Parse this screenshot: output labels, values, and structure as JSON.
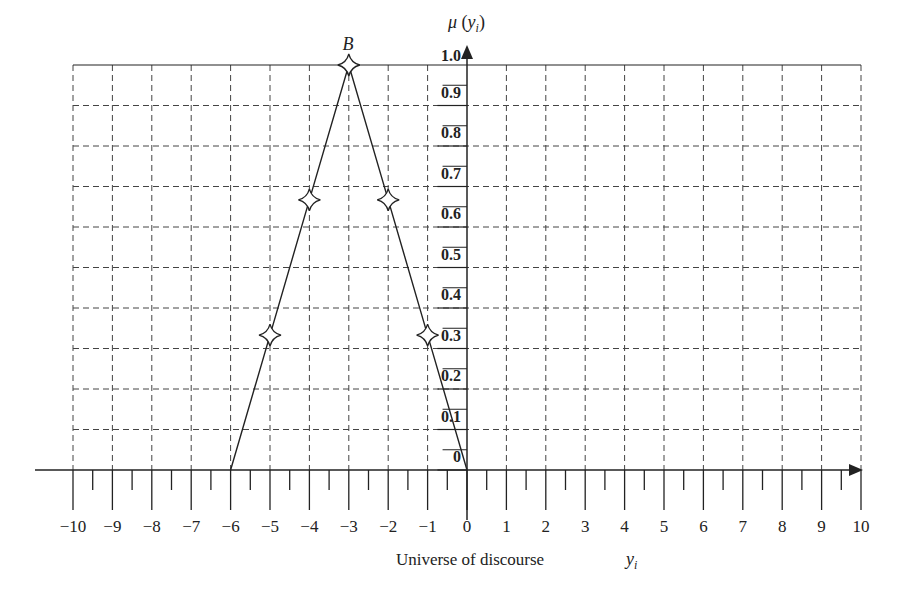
{
  "chart_data": {
    "type": "line",
    "title": "",
    "series": [
      {
        "name": "B",
        "x": [
          -6,
          -5,
          -4,
          -3,
          -2,
          -1,
          0
        ],
        "y": [
          0,
          0.333,
          0.667,
          1.0,
          0.667,
          0.333,
          0
        ],
        "markers": [
          {
            "x": -5,
            "y": 0.333
          },
          {
            "x": -4,
            "y": 0.667
          },
          {
            "x": -3,
            "y": 1.0
          },
          {
            "x": -2,
            "y": 0.667
          },
          {
            "x": -1,
            "y": 0.333
          }
        ]
      }
    ],
    "annotations": [
      {
        "text": "B",
        "x": -3,
        "y": 1.0
      }
    ],
    "xlabel": "Universe of discourse",
    "xvar": "y",
    "xvar_sub": "i",
    "ylabel": "μ (y_i)",
    "ylabel_parts": {
      "mu": "μ",
      "open": " (",
      "var": "y",
      "sub": "i",
      "close": ")"
    },
    "xlim": [
      -10,
      10
    ],
    "ylim": [
      0,
      1.0
    ],
    "xticks": [
      "−10",
      "−9",
      "−8",
      "−7",
      "−6",
      "−5",
      "−4",
      "−3",
      "−2",
      "−1",
      "0",
      "1",
      "2",
      "3",
      "4",
      "5",
      "6",
      "7",
      "8",
      "9",
      "10"
    ],
    "yticks": [
      "0",
      "0.1",
      "0.2",
      "0.3",
      "0.4",
      "0.5",
      "0.6",
      "0.7",
      "0.8",
      "0.9",
      "1.0"
    ],
    "grid": true,
    "grid_style": "dashed",
    "legend": null
  },
  "colors": {
    "line": "#222222",
    "grid": "#444444",
    "background": "#ffffff"
  }
}
